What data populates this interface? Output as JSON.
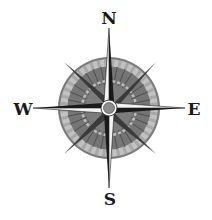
{
  "compass": {
    "labels": {
      "north": "N",
      "east": "E",
      "south": "S",
      "west": "W"
    },
    "colors": {
      "background": "#ffffff",
      "ring_outer": "#8a8a8a",
      "ring_light": "#b5b5b5",
      "ring_dark": "#6e6e6e",
      "needle_dark": "#1a1a1a",
      "needle_light": "#f2f2f2",
      "hub": "#8c8c8c"
    }
  }
}
